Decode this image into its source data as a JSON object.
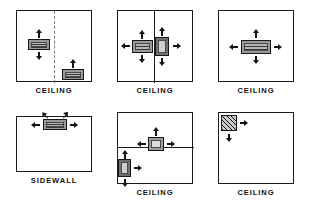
{
  "figure": {
    "title": "",
    "panel_count": 6,
    "rows": 2,
    "columns": 3
  },
  "labels": {
    "ceiling": "CEILING",
    "sidewall": "SIDEWALL"
  },
  "colors": {
    "outline": "#1c1c1c",
    "diffuser_fill": "#9a9a9a",
    "diffuser_inner": "#b5b5b5",
    "arrow": "#141414",
    "dashed_divider": "#7a7a7a",
    "background": "#ffffff",
    "text": "#111111"
  },
  "panels": [
    {
      "id": "panel-1",
      "caption": "CEILING",
      "mount": "ceiling",
      "divider": "vertical-dashed",
      "diffusers": [
        {
          "name": "diffuser-left",
          "style": "linear-slot",
          "arrows": [
            "up",
            "down"
          ]
        },
        {
          "name": "diffuser-lower-right",
          "style": "linear-slot",
          "arrows": [
            "up"
          ]
        }
      ]
    },
    {
      "id": "panel-2",
      "caption": "CEILING",
      "mount": "ceiling",
      "divider": "vertical-solid",
      "diffusers": [
        {
          "name": "diffuser-left-of-wall",
          "style": "linear-slot",
          "arrows": [
            "up",
            "down",
            "left"
          ]
        },
        {
          "name": "diffuser-right-of-wall",
          "style": "cone",
          "arrows": [
            "up",
            "down",
            "right"
          ]
        }
      ]
    },
    {
      "id": "panel-3",
      "caption": "CEILING",
      "mount": "ceiling",
      "divider": "none",
      "diffusers": [
        {
          "name": "diffuser-center",
          "style": "linear-slot",
          "arrows": [
            "up",
            "down",
            "left",
            "right"
          ]
        }
      ]
    },
    {
      "id": "panel-4",
      "caption": "SIDEWALL",
      "mount": "sidewall",
      "divider": "none",
      "diffusers": [
        {
          "name": "diffuser-top-center",
          "style": "grille",
          "arrows": [
            "left",
            "right",
            "up-left",
            "up-right"
          ]
        }
      ]
    },
    {
      "id": "panel-5",
      "caption": "CEILING",
      "mount": "ceiling",
      "divider": "horizontal-solid",
      "diffusers": [
        {
          "name": "diffuser-on-divider",
          "style": "grille",
          "arrows": [
            "up",
            "left",
            "right"
          ]
        },
        {
          "name": "diffuser-left-wall",
          "style": "cone",
          "arrows": [
            "up",
            "down",
            "right"
          ]
        }
      ]
    },
    {
      "id": "panel-6",
      "caption": "CEILING",
      "mount": "ceiling",
      "divider": "none",
      "diffusers": [
        {
          "name": "diffuser-corner",
          "style": "hatched-corner",
          "arrows": [
            "right",
            "down"
          ]
        }
      ]
    }
  ]
}
